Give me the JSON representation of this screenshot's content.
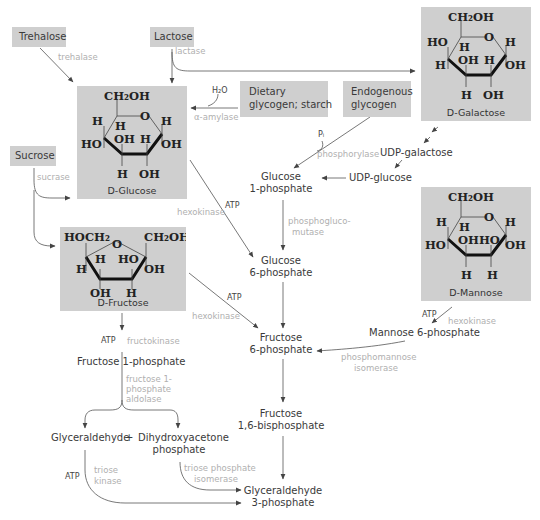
{
  "sources": {
    "trehalose": "Trehalose",
    "lactose": "Lactose",
    "sucrose": "Sucrose",
    "dietary": [
      "Dietary",
      "glycogen; starch"
    ],
    "endogenous": [
      "Endogenous",
      "glycogen"
    ]
  },
  "sugars": {
    "glucose": {
      "name": "D-Glucose",
      "prefix": "D",
      "suffix": "-Glucose",
      "top": "CH₂OH",
      "ring_o": "O",
      "c4_up": "H",
      "c4_down": "HO",
      "c5_down": "H",
      "c1_up": "H",
      "c1_down": "OH",
      "c3_up": "OH",
      "c2_up": "H",
      "c3_down": "H",
      "c2_down": "OH"
    },
    "galactose": {
      "name": "D-Galactose",
      "prefix": "D",
      "suffix": "-Galactose",
      "top": "CH₂OH",
      "ring_o": "O",
      "c4_up": "HO",
      "c4_down": "H",
      "c5_down": "H",
      "c1_up": "H",
      "c1_down": "OH",
      "c3_up": "OH",
      "c2_up": "H",
      "c3_down": "H",
      "c2_down": "OH"
    },
    "mannose": {
      "name": "D-Mannose",
      "prefix": "D",
      "suffix": "-Mannose",
      "top": "CH₂OH",
      "ring_o": "O",
      "c4_up": "H",
      "c4_down": "HO",
      "c5_down": "H",
      "c1_up": "H",
      "c1_down": "OH",
      "c3_up": "OH",
      "c2_up": "HO",
      "c3_down": "H",
      "c2_down": "H"
    },
    "fructose": {
      "name": "D-Fructose",
      "prefix": "D",
      "suffix": "-Fructose",
      "left_top": "HOCH₂",
      "right_top": "CH₂OH",
      "ring_o": "O",
      "c5_down": "H",
      "c4_up": "H",
      "c3_up": "HO",
      "c2_down": "OH",
      "c4_down": "OH",
      "c3_down": "H"
    }
  },
  "enzymes": {
    "trehalase": "trehalase",
    "lactase": "lactase",
    "sucrase": "sucrase",
    "amylase": "α-amylase",
    "phosphorylase": "phosphorylase",
    "hexokinase_glc": "hexokinase",
    "hexokinase_fru": "hexokinase",
    "hexokinase_man": "hexokinase",
    "phosphoglucomutase": [
      "phosphogluco-",
      "mutase"
    ],
    "fructokinase": "fructokinase",
    "f1p_aldolase": [
      "fructose 1-",
      "phosphate",
      "aldolase"
    ],
    "phosphomannose_isomerase": [
      "phosphomannose",
      "isomerase"
    ],
    "triose_kinase": [
      "triose",
      "kinase"
    ],
    "triose_phosphate_isomerase": [
      "triose phosphate",
      "isomerase"
    ]
  },
  "cofactors": {
    "h2o": "H₂O",
    "pi": "Pᵢ",
    "atp_glc": "ATP",
    "atp_fru": "ATP",
    "atp_man": "ATP",
    "atp_fk": "ATP",
    "atp_tk": "ATP"
  },
  "intermediates": {
    "g1p": [
      "Glucose",
      "1-phosphate"
    ],
    "g6p": [
      "Glucose",
      "6-phosphate"
    ],
    "f6p": [
      "Fructose",
      "6-phosphate"
    ],
    "f16bp": [
      "Fructose",
      "1,6-bisphosphate"
    ],
    "gap": [
      "Glyceraldehyde",
      "3-phosphate"
    ],
    "udp_gal": "UDP-galactose",
    "udp_glc": "UDP-glucose",
    "m6p": "Mannose 6-phosphate",
    "f1p": "Fructose 1-phosphate",
    "glyceraldehyde": "Glyceraldehyde",
    "plus": "+",
    "dhap": [
      "Dihydroxyacetone",
      "phosphate"
    ]
  }
}
